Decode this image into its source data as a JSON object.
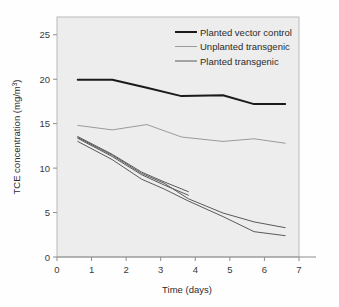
{
  "chart_data": {
    "type": "line",
    "title": "",
    "xlabel": "Time (days)",
    "ylabel": "TCE concentration (mg/m³)",
    "ylabel_main": "TCE concentration (mg/m",
    "ylabel_sup": "3",
    "ylabel_tail": ")",
    "xlim": [
      0,
      7
    ],
    "ylim": [
      0,
      27
    ],
    "xticks": [
      0,
      1,
      2,
      3,
      4,
      5,
      6,
      7
    ],
    "yticks": [
      0,
      5,
      10,
      15,
      20,
      25
    ],
    "xtick_labels": [
      "0",
      "1",
      "2",
      "3",
      "4",
      "5",
      "6",
      "7"
    ],
    "ytick_labels": [
      "0",
      "5",
      "10",
      "15",
      "20",
      "25"
    ],
    "grid": false,
    "legend_position": "top-right-inside",
    "plot_background": "#ededed",
    "series": [
      {
        "name": "Planted vector control",
        "color": "#1a1a1a",
        "width": 2.0,
        "x": [
          0.6,
          1.6,
          2.6,
          3.6,
          4.8,
          5.7,
          6.6
        ],
        "y": [
          19.95,
          19.95,
          19.05,
          18.1,
          18.2,
          17.2,
          17.2
        ]
      },
      {
        "name": "Unplanted transgenic",
        "color": "#9a9a9a",
        "width": 1.0,
        "x": [
          0.6,
          1.6,
          2.6,
          3.6,
          4.8,
          5.7,
          6.6
        ],
        "y": [
          14.8,
          14.3,
          14.9,
          13.5,
          13.0,
          13.3,
          12.8
        ]
      },
      {
        "name": "Planted transgenic",
        "color": "#5a5a5a",
        "width": 1.0,
        "replicate": 1,
        "x": [
          0.6,
          1.6,
          2.45,
          3.1,
          3.8
        ],
        "y": [
          13.55,
          11.55,
          9.55,
          8.45,
          7.35
        ]
      },
      {
        "name": "Planted transgenic",
        "color": "#5a5a5a",
        "width": 1.0,
        "replicate": 2,
        "x": [
          0.6,
          1.6,
          2.45,
          3.1,
          3.8
        ],
        "y": [
          13.35,
          11.3,
          9.25,
          8.1,
          6.95
        ]
      },
      {
        "name": "Planted transgenic",
        "color": "#5a5a5a",
        "width": 1.0,
        "replicate": 3,
        "x": [
          0.6,
          1.6,
          2.45,
          3.1,
          3.8,
          4.8,
          5.7,
          6.6
        ],
        "y": [
          13.45,
          11.45,
          9.4,
          8.3,
          6.55,
          4.95,
          3.95,
          3.3
        ]
      },
      {
        "name": "Planted transgenic",
        "color": "#5a5a5a",
        "width": 1.0,
        "replicate": 4,
        "x": [
          0.6,
          1.6,
          2.45,
          3.1,
          3.8,
          4.8,
          5.7,
          6.6
        ],
        "y": [
          13.0,
          10.95,
          8.75,
          7.65,
          6.3,
          4.55,
          2.85,
          2.4
        ]
      }
    ],
    "legend": [
      {
        "label": "Planted vector control",
        "color": "#1a1a1a",
        "width": 2.0
      },
      {
        "label": "Unplanted transgenic",
        "color": "#9a9a9a",
        "width": 1.0
      },
      {
        "label": "Planted transgenic",
        "color": "#5a5a5a",
        "width": 1.0
      }
    ]
  }
}
